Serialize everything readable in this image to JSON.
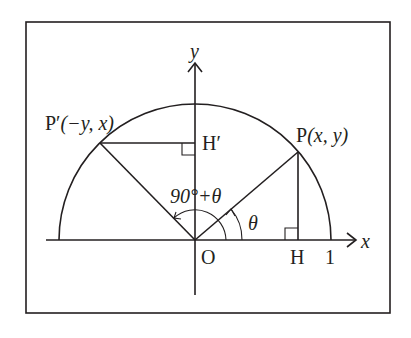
{
  "diagram": {
    "type": "unit-circle-rotation",
    "axes": {
      "x_label": "x",
      "y_label": "y",
      "origin_label": "O"
    },
    "points": {
      "P": {
        "name": "P",
        "coords": "(x,  y)"
      },
      "P_prime": {
        "name": "P′",
        "coords": "(−y,  x)"
      },
      "H": {
        "name": "H"
      },
      "H_prime": {
        "name": "H′"
      }
    },
    "tick_one": "1",
    "angles": {
      "theta": "θ",
      "ninety_plus_theta": "90°+θ"
    },
    "colors": {
      "ink": "#231f20",
      "background": "#ffffff"
    }
  }
}
